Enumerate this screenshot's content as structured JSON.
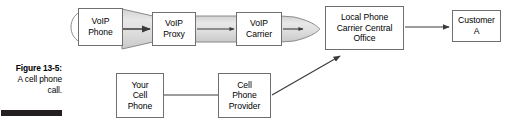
{
  "figure": {
    "caption_title": "Figure 13-5:",
    "caption_lines": [
      "A cell phone",
      "call."
    ],
    "rule_color": "#231f20"
  },
  "diagram": {
    "type": "flow-diagram",
    "nodes": [
      {
        "id": "voip-phone",
        "label": "VoIP\nPhone",
        "x": 78,
        "y": 8,
        "w": 45,
        "h": 38
      },
      {
        "id": "voip-proxy",
        "label": "VoIP\nProxy",
        "x": 152,
        "y": 12,
        "w": 44,
        "h": 34
      },
      {
        "id": "voip-carrier",
        "label": "VoIP\nCarrier",
        "x": 236,
        "y": 12,
        "w": 46,
        "h": 34
      },
      {
        "id": "local-phone-carrier-central-office",
        "label": "Local Phone\nCarrier Central\nOffice",
        "x": 325,
        "y": 6,
        "w": 79,
        "h": 44
      },
      {
        "id": "customer-a",
        "label": "Customer\nA",
        "x": 452,
        "y": 10,
        "w": 49,
        "h": 32
      },
      {
        "id": "your-cell-phone",
        "label": "Your\nCell\nPhone",
        "x": 116,
        "y": 73,
        "w": 48,
        "h": 45
      },
      {
        "id": "cell-phone-provider",
        "label": "Cell\nPhone\nProvider",
        "x": 218,
        "y": 73,
        "w": 53,
        "h": 45
      }
    ],
    "pipe": {
      "name": "voip-transport-pipe",
      "fill": "#dcdcdc",
      "stroke": "#8a8a8a"
    },
    "connectors": [
      {
        "id": "voip-phone-to-voip-proxy",
        "kind": "arrow"
      },
      {
        "id": "voip-proxy-to-voip-carrier",
        "kind": "arrow"
      },
      {
        "id": "voip-carrier-to-central-office",
        "kind": "arrow"
      },
      {
        "id": "central-office-to-customer-a",
        "kind": "arrow"
      },
      {
        "id": "your-cell-phone-to-cell-phone-provider",
        "kind": "line"
      },
      {
        "id": "cell-phone-provider-to-central-office",
        "kind": "arrow-diagonal"
      }
    ],
    "stroke_color": "#3b3b3b",
    "box_stroke": "#6f6f6f"
  }
}
